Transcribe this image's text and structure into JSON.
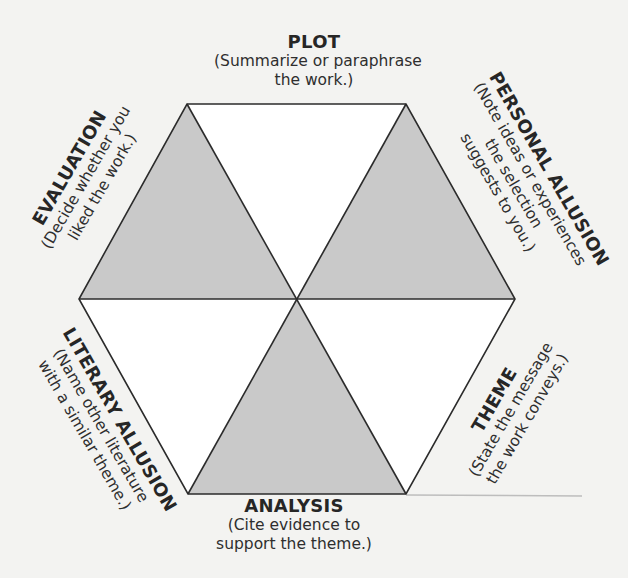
{
  "diagram": {
    "type": "hexagon-response-organizer",
    "colors": {
      "background": "#f3f3f1",
      "stroke": "#2b2b2b",
      "shaded_fill": "#c9c9c9",
      "unshaded_fill": "#ffffff",
      "faint_line": "#bdbdbd"
    },
    "geometry": {
      "center": [
        296,
        299
      ],
      "vertices": {
        "top_left": [
          187,
          104
        ],
        "top_right": [
          406,
          104
        ],
        "right": [
          515,
          299
        ],
        "bottom_right": [
          406,
          494
        ],
        "bottom_left": [
          188,
          494
        ],
        "left": [
          79,
          299
        ]
      },
      "shaded_triangles": [
        "upper-left",
        "upper-right",
        "bottom"
      ]
    },
    "sections": {
      "plot": {
        "title": "PLOT",
        "desc": [
          "(Summarize or paraphrase",
          "the work.)"
        ]
      },
      "personal_allusion": {
        "title": "PERSONAL ALLUSION",
        "desc": [
          "(Note ideas or experiences",
          "the selection",
          "suggests to you.)"
        ]
      },
      "theme": {
        "title": "THEME",
        "desc": [
          "(State the message",
          "the work conveys.)"
        ]
      },
      "analysis": {
        "title": "ANALYSIS",
        "desc": [
          "(Cite evidence to",
          "support the theme.)"
        ]
      },
      "literary_allusion": {
        "title": "LITERARY ALLUSION",
        "desc": [
          "(Name other literature",
          "with a similar theme.)"
        ]
      },
      "evaluation": {
        "title": "EVALUATION",
        "desc": [
          "(Decide whether you",
          "liked the work.)"
        ]
      }
    }
  }
}
